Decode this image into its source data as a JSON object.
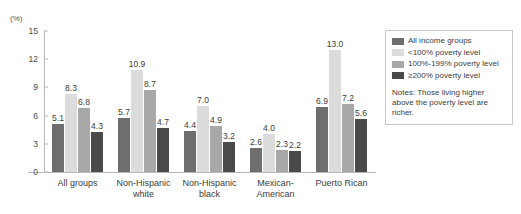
{
  "chart_data": {
    "type": "bar",
    "title": "",
    "xlabel": "",
    "ylabel": "(%)",
    "ylim": [
      0,
      15
    ],
    "yticks": [
      "0",
      "3",
      "6",
      "9",
      "12",
      "15"
    ],
    "grid": false,
    "legend_position": "right",
    "categories": [
      "All groups",
      "Non-Hispanic\nwhite",
      "Non-Hispanic\nblack",
      "Mexican-\nAmerican",
      "Puerto Rican"
    ],
    "series": [
      {
        "name": "All income groups",
        "color": "#6e6e6e",
        "values": [
          5.1,
          5.7,
          4.4,
          2.6,
          6.9
        ],
        "labels": [
          "5.1",
          "5.7",
          "4.4",
          "2.6",
          "6.9"
        ]
      },
      {
        "name": "<100% poverty level",
        "color": "#dcdcdc",
        "values": [
          8.3,
          10.9,
          7.0,
          4.0,
          13.0
        ],
        "labels": [
          "8.3",
          "10.9",
          "7.0",
          "4.0",
          "13.0"
        ]
      },
      {
        "name": "100%-199% poverty level",
        "color": "#a8a8a8",
        "values": [
          6.8,
          8.7,
          4.9,
          2.3,
          7.2
        ],
        "labels": [
          "6.8",
          "8.7",
          "4.9",
          "2.3",
          "7.2"
        ]
      },
      {
        "name": "≥200% poverty level",
        "color": "#4a4a4a",
        "values": [
          4.3,
          4.7,
          3.2,
          2.2,
          5.6
        ],
        "labels": [
          "4.3",
          "4.7",
          "3.2",
          "2.2",
          "5.6"
        ]
      }
    ],
    "notes": "Notes: Those living higher above the poverty level are richer."
  },
  "axis": {
    "unit_label": "(%)"
  },
  "legend": {
    "items": [
      {
        "label": "All income groups"
      },
      {
        "label": "<100% poverty level"
      },
      {
        "label": "100%-199% poverty level"
      },
      {
        "label": "≥200% poverty level"
      }
    ],
    "note": "Notes: Those living higher above the poverty level are richer."
  },
  "colors": {
    "axis": "#b9b9b9",
    "text": "#3c3c3c",
    "legend_border": "#c8c8c8",
    "background": "#ffffff"
  }
}
